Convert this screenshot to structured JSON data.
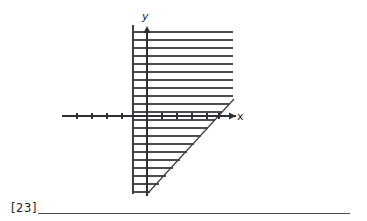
{
  "page": {
    "background_color": "#ffffff",
    "ink_color": "#3a3a42"
  },
  "figure": {
    "name": "hatched-region-coordinate-graph",
    "axes": {
      "x_axis": {
        "label": "x",
        "arrow": "right",
        "y_pixel": 116,
        "x_start": 62,
        "x_end": 236,
        "tick_count_left": 4,
        "tick_count_right": 5,
        "tick_spacing": 15
      },
      "y_axis": {
        "label": "y",
        "arrow": "up",
        "x_pixel": 147,
        "y_top": 28,
        "y_bottom": 196
      }
    },
    "boundaries": {
      "vertical_line": {
        "name": "left-vertical-boundary",
        "x_pixel": 133,
        "y_top": 25,
        "y_bottom": 194
      },
      "diagonal_line": {
        "name": "diagonal-boundary",
        "x_start": 148,
        "y_start": 193,
        "x_end": 233,
        "y_end": 100
      },
      "top_edge_y": 32,
      "right_edge_x": 233
    },
    "hatching": {
      "orientation": "horizontal",
      "line_spacing": 8,
      "line_count": 21,
      "color": "#4a4a52",
      "first_line_y": 32,
      "last_line_y": 192
    },
    "colors": {
      "stroke": "#3f3f47",
      "hatch": "#4c4c55"
    }
  },
  "footer": {
    "problem_number": "[23]",
    "answer_line_label": "answer-blank"
  }
}
